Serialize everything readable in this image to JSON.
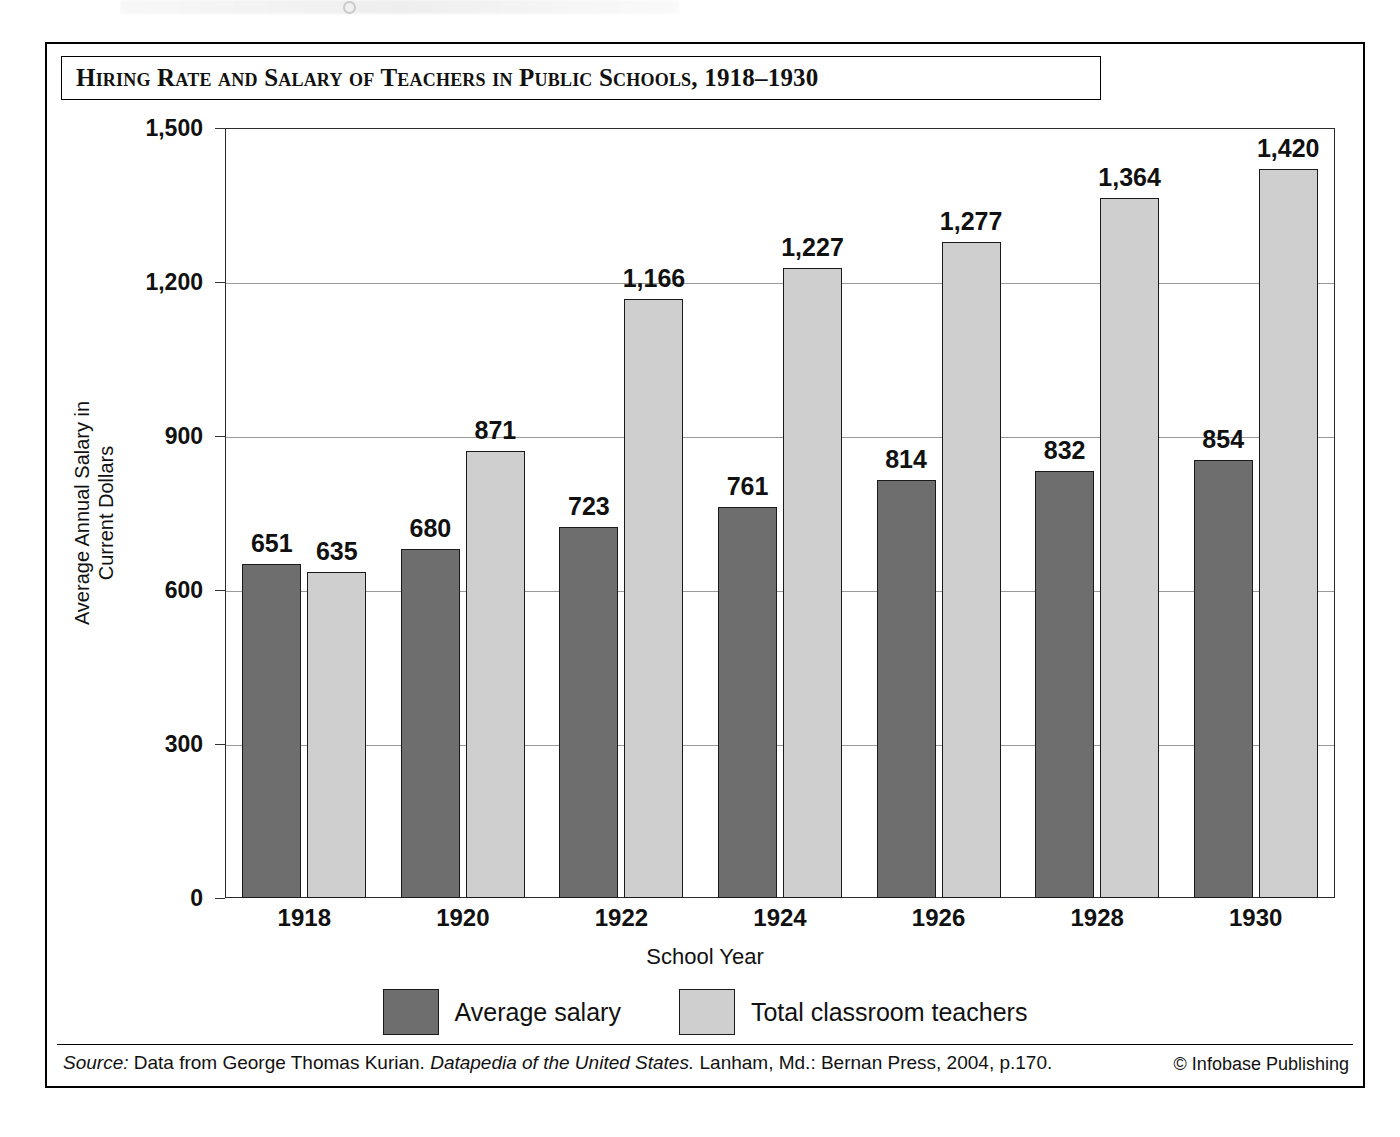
{
  "figure": {
    "title": "Hiring Rate and Salary of Teachers in Public Schools, 1918–1930",
    "source_prefix": "Source:",
    "source_text_a": " Data from George Thomas Kurian. ",
    "source_title": "Datapedia of the United States.",
    "source_text_b": " Lanham, Md.: Bernan Press, 2004, p.170.",
    "credit": "© Infobase Publishing"
  },
  "chart_data": {
    "type": "bar",
    "title": "Hiring Rate and Salary of Teachers in Public Schools, 1918–1930",
    "xlabel": "School Year",
    "ylabel": "Average Annual Salary in Current Dollars",
    "categories": [
      "1918",
      "1920",
      "1922",
      "1924",
      "1926",
      "1928",
      "1930"
    ],
    "series": [
      {
        "name": "Average salary",
        "color": "#6e6e6e",
        "values": [
          651,
          680,
          723,
          761,
          814,
          832,
          854
        ],
        "labels": [
          "651",
          "680",
          "723",
          "761",
          "814",
          "832",
          "854"
        ]
      },
      {
        "name": "Total classroom teachers",
        "color": "#cfcfcf",
        "values": [
          635,
          871,
          1166,
          1227,
          1277,
          1364,
          1420
        ],
        "labels": [
          "635",
          "871",
          "1,166",
          "1,227",
          "1,277",
          "1,364",
          "1,420"
        ]
      }
    ],
    "ylim": [
      0,
      1500
    ],
    "yticks": [
      0,
      300,
      600,
      900,
      1200,
      1500
    ],
    "ytick_labels": [
      "0",
      "300",
      "600",
      "900",
      "1,200",
      "1,500"
    ],
    "grid": true,
    "legend_position": "bottom"
  }
}
